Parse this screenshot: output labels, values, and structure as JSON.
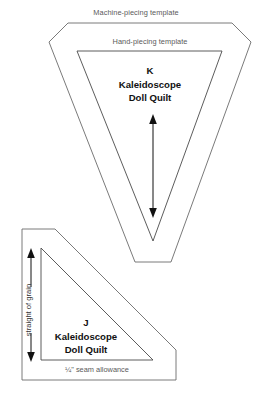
{
  "figure": {
    "background_color": "#ffffff",
    "line_color": "#5a5a5a",
    "text_color": "#111111"
  },
  "labels": {
    "machine_piecing": "Machine-piecing template",
    "hand_piecing": "Hand-piecing template",
    "seam_allowance": "¼\" seam allowance",
    "straight_of_grain": "straight of grain"
  },
  "pieces": [
    {
      "id": "K",
      "letter": "K",
      "name_line1": "Kaleidoscope",
      "name_line2": "Doll Quilt",
      "shape": "inverted-triangle",
      "has_grain_arrow": true,
      "grain_arrow_direction": "vertical-double"
    },
    {
      "id": "J",
      "letter": "J",
      "name_line1": "Kaleidoscope",
      "name_line2": "Doll Quilt",
      "shape": "right-triangle",
      "has_grain_arrow": true,
      "grain_arrow_direction": "vertical-double"
    }
  ]
}
